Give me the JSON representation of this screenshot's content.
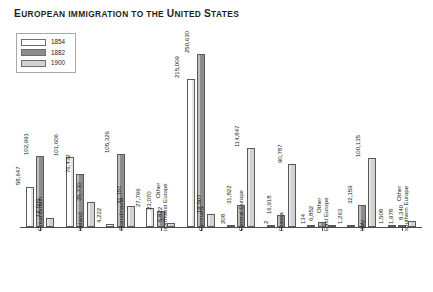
{
  "chart_data": {
    "type": "bar",
    "title": "European immigration to the United States",
    "xlabel": "",
    "ylabel": "",
    "ylim": [
      0,
      250630
    ],
    "grid": false,
    "legend_position": "top-left",
    "categories": [
      "Great Britain",
      "Ireland",
      "Scandinavia",
      "Other\nnorthwest Europe",
      "Germany",
      "Central Europe",
      "Russia",
      "Other\nEast Europe",
      "Italy",
      "Other\nsouthern Europe"
    ],
    "series": [
      {
        "name": "1854",
        "color": "#ffffff",
        "values": [
          58647,
          101606,
          4222,
          27796,
          215009,
          208,
          2,
          134,
          1263,
          1508
        ]
      },
      {
        "name": "1882",
        "color": "#8d8d8d",
        "values": [
          102991,
          76432,
          105326,
          23070,
          250630,
          31822,
          16918,
          6852,
          32159,
          1978
        ]
      },
      {
        "name": "1900",
        "color": "#d2d2d2",
        "values": [
          12509,
          35730,
          31151,
          5822,
          18507,
          114847,
          90787,
          0,
          100135,
          8340
        ]
      }
    ],
    "value_labels": [
      [
        "58,647",
        "102,991",
        "12,509"
      ],
      [
        "101,606",
        "76,432",
        "35,730"
      ],
      [
        "4,222",
        "105,326",
        "31,151"
      ],
      [
        "27,796",
        "23,070",
        "5,822"
      ],
      [
        "215,009",
        "250,630",
        "18,507"
      ],
      [
        "208",
        "31,822",
        "114,847"
      ],
      [
        "2",
        "16,918",
        "90,787"
      ],
      [
        "134",
        "6,852",
        ""
      ],
      [
        "1,263",
        "32,159",
        "100,135"
      ],
      [
        "1,508",
        "1,978",
        "8,340"
      ]
    ]
  },
  "legend": {
    "items": [
      {
        "label": "1854",
        "color": "#ffffff"
      },
      {
        "label": "1882",
        "color": "#8d8d8d"
      },
      {
        "label": "1900",
        "color": "#d2d2d2"
      }
    ]
  },
  "title_parts": {
    "w1": "E",
    "w1r": "uropean",
    "w2": "immigration to the",
    "w3": "U",
    "w3r": "nited",
    "w4": "S",
    "w4r": "tates"
  }
}
